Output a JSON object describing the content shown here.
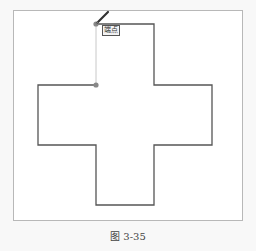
{
  "figure": {
    "caption": "图 3-35",
    "tooltip": "端点",
    "colors": {
      "outline": "#555555",
      "guide": "#c8c8c8",
      "point": "#888888",
      "frame": "#b8b8b8"
    },
    "shape": {
      "type": "cross-polyline",
      "points": [
        [
          96,
          24
        ],
        [
          154,
          24
        ],
        [
          154,
          85
        ],
        [
          212,
          85
        ],
        [
          212,
          145
        ],
        [
          154,
          145
        ],
        [
          154,
          205
        ],
        [
          96,
          205
        ],
        [
          96,
          145
        ],
        [
          38,
          145
        ],
        [
          38,
          85
        ],
        [
          96,
          85
        ]
      ],
      "open_segment": [
        [
          96,
          85
        ],
        [
          96,
          24
        ]
      ]
    },
    "markers": [
      {
        "name": "start-point",
        "x": 96,
        "y": 24
      },
      {
        "name": "current-point",
        "x": 96,
        "y": 85
      }
    ],
    "cursor": "pencil-icon"
  }
}
